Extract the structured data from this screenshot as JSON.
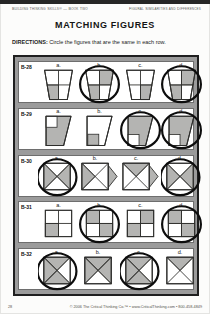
{
  "page": {
    "header_left": "Building Thinking Skills® — Book Two",
    "header_right": "Figural Similarities and Differences",
    "title": "MATCHING FIGURES",
    "directions_label": "DIRECTIONS:",
    "directions_text": " Circle the figures that are the same in each row.",
    "footer_left": "28",
    "footer_right": "© 2006 The Critical Thinking Co.™ • www.CriticalThinking.com • 800-458-4849"
  },
  "colors": {
    "shade": "#b4b4b2",
    "outline": "#2e2e2c",
    "frame_bg": "#9b9b9b",
    "circle": "#0d0d0d"
  },
  "rows": [
    {
      "label": "B-28",
      "shape": "trapezoid-quadrants",
      "figures": [
        {
          "letter": "a.",
          "shaded": [
            "bottom-left"
          ],
          "circled": false
        },
        {
          "letter": "b.",
          "shaded": [
            "top-right",
            "bottom-left"
          ],
          "circled": true
        },
        {
          "letter": "c.",
          "shaded": [
            "bottom-right"
          ],
          "circled": false
        },
        {
          "letter": "d.",
          "shaded": [
            "top-right",
            "bottom-left"
          ],
          "circled": true
        }
      ]
    },
    {
      "label": "B-29",
      "shape": "notched-quad",
      "figures": [
        {
          "letter": "a.",
          "variant": "gray-shape-white-notch",
          "notch": "top-left",
          "circled": false
        },
        {
          "letter": "b.",
          "variant": "white-shape-gray-square",
          "notch": "bottom-left",
          "circled": false
        },
        {
          "letter": "c.",
          "variant": "gray-shape-white-notch",
          "notch": "bottom-left",
          "circled": true
        },
        {
          "letter": "d.",
          "variant": "gray-shape-white-notch",
          "notch": "bottom-left",
          "circled": true
        }
      ]
    },
    {
      "label": "B-30",
      "shape": "x-square",
      "figures": [
        {
          "letter": "a.",
          "shaded": [
            "left",
            "right"
          ],
          "ext_right": false,
          "circled": true
        },
        {
          "letter": "b.",
          "shaded": [
            "left"
          ],
          "ext_right": true,
          "circled": false
        },
        {
          "letter": "c.",
          "shaded": [
            "top"
          ],
          "ext_right": true,
          "circled": false
        },
        {
          "letter": "d.",
          "shaded": [
            "left",
            "right"
          ],
          "ext_right": false,
          "circled": true
        }
      ]
    },
    {
      "label": "B-31",
      "shape": "grid-square",
      "figures": [
        {
          "letter": "a.",
          "shaded": [
            "bottom-left"
          ],
          "circled": false
        },
        {
          "letter": "b.",
          "shaded": [
            "top-left",
            "bottom-right"
          ],
          "circled": true
        },
        {
          "letter": "c.",
          "shaded": [
            "top-right",
            "bottom-left"
          ],
          "circled": false
        },
        {
          "letter": "d.",
          "shaded": [
            "top-left",
            "bottom-right"
          ],
          "circled": true
        }
      ]
    },
    {
      "label": "B-32",
      "shape": "x-square",
      "figures": [
        {
          "letter": "a.",
          "shaded": [
            "top",
            "left",
            "bottom"
          ],
          "ext_right": false,
          "circled": true
        },
        {
          "letter": "b.",
          "shaded": [
            "top",
            "left",
            "right"
          ],
          "ext_right": false,
          "circled": false
        },
        {
          "letter": "c.",
          "shaded": [
            "top",
            "left",
            "bottom"
          ],
          "ext_right": false,
          "circled": true
        },
        {
          "letter": "d.",
          "shaded": [
            "top"
          ],
          "ext_right": false,
          "circled": false
        }
      ]
    }
  ]
}
